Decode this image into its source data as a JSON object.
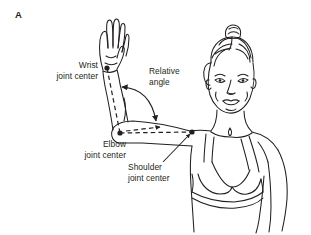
{
  "figure": {
    "panel_letter": "A",
    "background_color": "#ffffff",
    "ink_color": "#231f20",
    "labels": {
      "wrist": {
        "line1": "Wrist",
        "line2": "joint center"
      },
      "relative_angle": {
        "line1": "Relative",
        "line2": "angle"
      },
      "elbow": {
        "line1": "Elbow",
        "line2": "joint center"
      },
      "shoulder": {
        "line1": "Shoulder",
        "line2": "joint center"
      }
    },
    "joint_markers": [
      {
        "name": "wrist-joint-marker",
        "x": 107,
        "y": 68
      },
      {
        "name": "elbow-joint-marker",
        "x": 120,
        "y": 133
      },
      {
        "name": "shoulder-joint-marker",
        "x": 192,
        "y": 132
      }
    ],
    "segment_axes": [
      {
        "name": "forearm-axis",
        "style": "dashed",
        "from": [
          107,
          68
        ],
        "to": [
          120,
          133
        ]
      },
      {
        "name": "upper-arm-axis",
        "style": "dashed",
        "from": [
          120,
          133
        ],
        "to": [
          192,
          132
        ]
      },
      {
        "name": "upper-arm-extension-axis",
        "style": "dashed",
        "from": [
          120,
          133
        ],
        "to": [
          163,
          127
        ]
      }
    ],
    "angle_arc": {
      "name": "relative-angle-arc",
      "description": "double-headed curved arrow spanning from the forearm axis to the upper arm axis"
    }
  }
}
